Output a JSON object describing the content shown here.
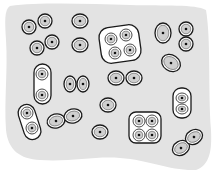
{
  "diagram": {
    "background": {
      "fill": "#e3e3e3",
      "path": "M10,6 C40,2 90,4 130,5 C165,6 195,4 206,10 C211,40 208,90 211,130 C212,150 210,165 196,170 C170,171 150,160 120,158 C95,156 70,162 40,160 C20,159 8,150 6,130 C4,100 8,70 6,40 C5,22 4,10 10,6 Z"
    },
    "colors": {
      "outline": "#1a1a1a",
      "cell_fill": "#ffffff",
      "inner_fill": "#cfcfcf",
      "nucleus": "#111111"
    },
    "groups": [
      {
        "type": "single",
        "cells": [
          {
            "x": 29,
            "y": 27
          }
        ],
        "rx": 7,
        "ry": 7
      },
      {
        "type": "single",
        "cells": [
          {
            "x": 45,
            "y": 21
          }
        ],
        "rx": 7,
        "ry": 7
      },
      {
        "type": "single",
        "cells": [
          {
            "x": 37,
            "y": 48
          }
        ],
        "rx": 7,
        "ry": 7
      },
      {
        "type": "single",
        "cells": [
          {
            "x": 52,
            "y": 42
          }
        ],
        "rx": 7,
        "ry": 7
      },
      {
        "type": "single",
        "cells": [
          {
            "x": 80,
            "y": 21
          }
        ],
        "rx": 8,
        "ry": 7
      },
      {
        "type": "single",
        "cells": [
          {
            "x": 80,
            "y": 45
          }
        ],
        "rx": 8,
        "ry": 7
      },
      {
        "type": "single",
        "cells": [
          {
            "x": 163,
            "y": 33
          }
        ],
        "rx": 8,
        "ry": 10
      },
      {
        "type": "single",
        "cells": [
          {
            "x": 171,
            "y": 63
          }
        ],
        "rx": 10,
        "ry": 8,
        "rotate": 35
      },
      {
        "type": "single",
        "cells": [
          {
            "x": 108,
            "y": 105
          }
        ],
        "rx": 8,
        "ry": 7
      },
      {
        "type": "single",
        "cells": [
          {
            "x": 100,
            "y": 132
          }
        ],
        "rx": 8,
        "ry": 7
      },
      {
        "type": "tetrad",
        "box": {
          "x": 100,
          "y": 26,
          "w": 40,
          "h": 36,
          "r": 10,
          "rotate": -8
        },
        "cells": [
          {
            "x": 111,
            "y": 39
          },
          {
            "x": 126,
            "y": 35
          },
          {
            "x": 115,
            "y": 53
          },
          {
            "x": 130,
            "y": 50
          }
        ],
        "rx": 6,
        "ry": 6
      },
      {
        "type": "pair-stacked",
        "cells": [
          {
            "x": 186,
            "y": 29
          },
          {
            "x": 186,
            "y": 44
          }
        ],
        "rx": 7,
        "ry": 7
      },
      {
        "type": "pair-capsule",
        "capsule": {
          "x": 34,
          "y": 64,
          "w": 17,
          "h": 40,
          "r": 8.5,
          "rotate": 0
        },
        "cells": [
          {
            "x": 42,
            "y": 74
          },
          {
            "x": 42,
            "y": 95
          }
        ],
        "rx": 6,
        "ry": 6
      },
      {
        "type": "pair",
        "cells": [
          {
            "x": 70,
            "y": 84
          },
          {
            "x": 83,
            "y": 84
          }
        ],
        "rx": 6,
        "ry": 8
      },
      {
        "type": "pair",
        "cells": [
          {
            "x": 116,
            "y": 78
          },
          {
            "x": 134,
            "y": 78
          }
        ],
        "rx": 8,
        "ry": 7
      },
      {
        "type": "pair-capsule",
        "capsule": {
          "x": 173,
          "y": 88,
          "w": 18,
          "h": 30,
          "r": 8,
          "rotate": 0
        },
        "cells": [
          {
            "x": 182,
            "y": 98
          },
          {
            "x": 182,
            "y": 109
          }
        ],
        "rx": 6,
        "ry": 5
      },
      {
        "type": "pair-capsule",
        "capsule": {
          "x": 21,
          "y": 104,
          "w": 17,
          "h": 36,
          "r": 8.5,
          "rotate": -18
        },
        "cells": [
          {
            "x": 27,
            "y": 113
          },
          {
            "x": 32,
            "y": 128
          }
        ],
        "rx": 6,
        "ry": 6
      },
      {
        "type": "pair-touching",
        "cells": [
          {
            "x": 56,
            "y": 121
          },
          {
            "x": 73,
            "y": 116
          }
        ],
        "rx": 9,
        "ry": 7,
        "rotate": -15
      },
      {
        "type": "tetrad",
        "box": {
          "x": 129,
          "y": 112,
          "w": 32,
          "h": 31,
          "r": 7,
          "rotate": 0
        },
        "cells": [
          {
            "x": 139,
            "y": 121
          },
          {
            "x": 152,
            "y": 121
          },
          {
            "x": 139,
            "y": 135
          },
          {
            "x": 152,
            "y": 135
          }
        ],
        "rx": 6,
        "ry": 6
      },
      {
        "type": "pair-touching",
        "cells": [
          {
            "x": 181,
            "y": 148
          },
          {
            "x": 194,
            "y": 137
          }
        ],
        "rx": 9,
        "ry": 7,
        "rotate": -30
      }
    ]
  }
}
